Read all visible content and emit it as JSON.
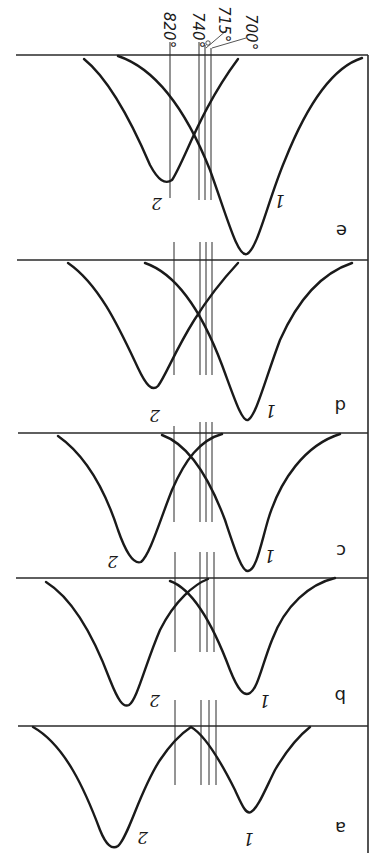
{
  "figure": {
    "orientation": "rotated 180 degrees (scanned upside down)",
    "temperature_markers": [
      {
        "label": "820°",
        "x": 170
      },
      {
        "label": "740°",
        "x": 199
      },
      {
        "label": "715°",
        "x": 205
      },
      {
        "label": "700°",
        "x": 211
      }
    ],
    "panels": [
      {
        "id": "e",
        "label": "e",
        "curve_labels": [
          "1",
          "2"
        ]
      },
      {
        "id": "d",
        "label": "d",
        "curve_labels": [
          "1",
          "2"
        ]
      },
      {
        "id": "c",
        "label": "c",
        "curve_labels": [
          "1",
          "2"
        ]
      },
      {
        "id": "b",
        "label": "b",
        "curve_labels": [
          "1",
          "2"
        ]
      },
      {
        "id": "a",
        "label": "a",
        "curve_labels": [
          "1",
          "2"
        ]
      }
    ]
  }
}
